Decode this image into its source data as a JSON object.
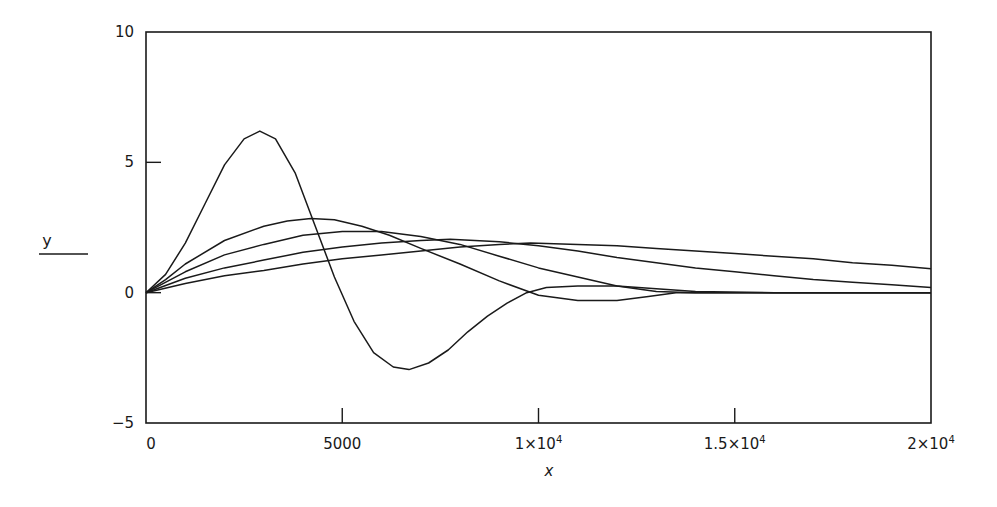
{
  "chart_data": {
    "type": "line",
    "title": "",
    "xlabel": "x",
    "ylabel": "y",
    "xlim": [
      0,
      20000
    ],
    "ylim": [
      -5,
      10
    ],
    "grid": false,
    "legend": null,
    "x_ticks": [
      {
        "value": 0,
        "label": "0"
      },
      {
        "value": 5000,
        "label": "5000"
      },
      {
        "value": 10000,
        "label": "1×10",
        "exp": "4"
      },
      {
        "value": 15000,
        "label": "1.5×10",
        "exp": "4"
      },
      {
        "value": 20000,
        "label": "2×10",
        "exp": "4"
      }
    ],
    "y_ticks": [
      {
        "value": -5,
        "label": "−5"
      },
      {
        "value": 0,
        "label": "0"
      },
      {
        "value": 5,
        "label": "5"
      },
      {
        "value": 10,
        "label": "10"
      }
    ],
    "series": [
      {
        "name": "curve-1",
        "x": [
          0,
          500,
          1000,
          1500,
          2000,
          2500,
          2900,
          3300,
          3800,
          4300,
          4800,
          5300,
          5800,
          6300,
          6700,
          7200,
          7700,
          8200,
          8700,
          9200,
          9700,
          10200,
          11000,
          12000,
          13000,
          14000,
          16000,
          18000,
          20000
        ],
        "values": [
          0,
          0.7,
          1.9,
          3.4,
          4.9,
          5.9,
          6.2,
          5.9,
          4.6,
          2.6,
          0.6,
          -1.1,
          -2.3,
          -2.85,
          -2.95,
          -2.7,
          -2.2,
          -1.5,
          -0.9,
          -0.4,
          0.0,
          0.2,
          0.25,
          0.25,
          0.15,
          0.05,
          0.0,
          0.0,
          0.0
        ]
      },
      {
        "name": "curve-2",
        "x": [
          0,
          500,
          1000,
          2000,
          3000,
          3600,
          4200,
          4800,
          5500,
          6200,
          7000,
          8000,
          9000,
          10000,
          11000,
          12000,
          12800,
          13500,
          14500,
          16000,
          18000,
          20000
        ],
        "values": [
          0,
          0.5,
          1.1,
          2.0,
          2.55,
          2.75,
          2.85,
          2.8,
          2.55,
          2.2,
          1.7,
          1.1,
          0.45,
          -0.1,
          -0.3,
          -0.3,
          -0.15,
          0.0,
          0.0,
          0.0,
          0.0,
          0.0
        ]
      },
      {
        "name": "curve-3",
        "x": [
          0,
          1000,
          2000,
          3000,
          4000,
          5000,
          6000,
          7000,
          8000,
          9000,
          10000,
          11000,
          12000,
          13000,
          14000,
          16000,
          18000,
          20000
        ],
        "values": [
          0,
          0.8,
          1.45,
          1.85,
          2.2,
          2.35,
          2.35,
          2.15,
          1.85,
          1.4,
          0.95,
          0.6,
          0.25,
          0.05,
          0.0,
          0.0,
          0.0,
          0.0
        ]
      },
      {
        "name": "curve-4",
        "x": [
          0,
          1000,
          2000,
          3000,
          4000,
          5000,
          6000,
          7000,
          7750,
          9000,
          10000,
          11000,
          12000,
          13000,
          14000,
          15000,
          16000,
          17000,
          18000,
          19000,
          20000
        ],
        "values": [
          0,
          0.55,
          0.95,
          1.25,
          1.55,
          1.75,
          1.9,
          2.0,
          2.05,
          1.95,
          1.8,
          1.6,
          1.35,
          1.15,
          0.95,
          0.8,
          0.65,
          0.5,
          0.4,
          0.3,
          0.2
        ]
      },
      {
        "name": "curve-5",
        "x": [
          0,
          1000,
          2000,
          3000,
          4000,
          5000,
          6000,
          7000,
          8000,
          9000,
          9800,
          11000,
          12000,
          13000,
          14000,
          15000,
          16000,
          17000,
          18000,
          19000,
          20000
        ],
        "values": [
          0,
          0.35,
          0.65,
          0.85,
          1.1,
          1.3,
          1.45,
          1.6,
          1.75,
          1.85,
          1.9,
          1.85,
          1.8,
          1.7,
          1.6,
          1.5,
          1.4,
          1.3,
          1.15,
          1.05,
          0.92
        ]
      }
    ]
  },
  "labels": {
    "x_axis": "x",
    "y_axis": "y"
  }
}
